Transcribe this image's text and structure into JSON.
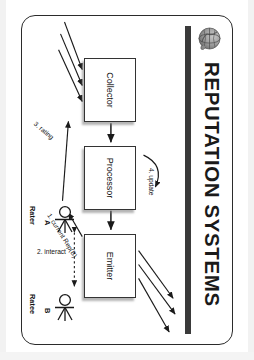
{
  "slide": {
    "title": "REPUTATION SYSTEMS",
    "logo_icon": "globe-icon",
    "diagram": {
      "nodes": [
        {
          "id": "collector",
          "label": "Collector"
        },
        {
          "id": "processor",
          "label": "Processor"
        },
        {
          "id": "emitter",
          "label": "Emitter"
        }
      ],
      "actors": [
        {
          "id": "rater",
          "letter": "A",
          "role": "Rater"
        },
        {
          "id": "ratee",
          "letter": "B",
          "role": "Ratee"
        }
      ],
      "steps": [
        {
          "n": "1",
          "label": "1. current Rep(B)"
        },
        {
          "n": "2",
          "label": "2. interact"
        },
        {
          "n": "3",
          "label": "3. rating"
        },
        {
          "n": "4",
          "label": "4. update"
        }
      ],
      "flow": {
        "inputs_to_collector": 3,
        "outputs_from_emitter": 3,
        "collector_to_processor": "solid-arrow",
        "processor_to_emitter": "solid-arrow",
        "interact_arrow_style": "dotted-double-headed"
      }
    }
  },
  "colors": {
    "page_background": "#ffffff",
    "slide_border": "#2b2b2b",
    "title_rule": "#3a3a3a",
    "box_border": "#333333",
    "text": "#111111"
  }
}
